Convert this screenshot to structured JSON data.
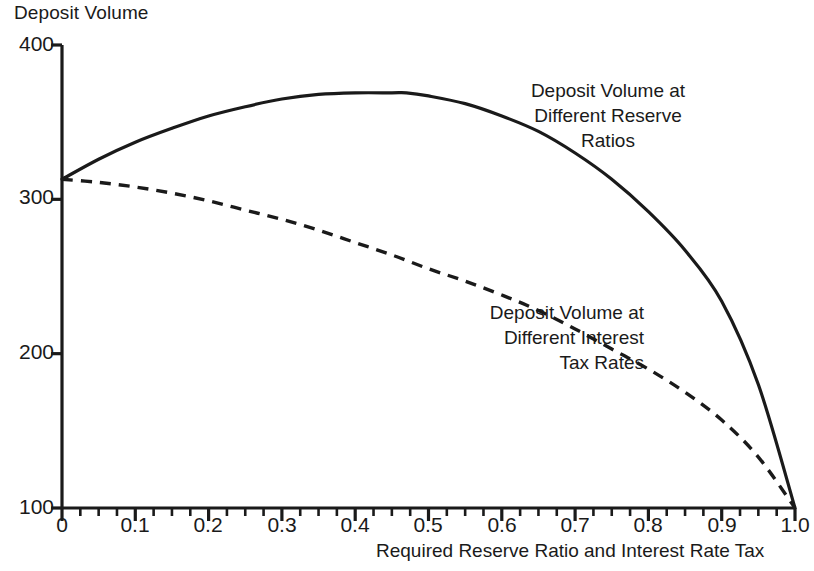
{
  "chart_data": {
    "type": "line",
    "title": "",
    "ylabel": "Deposit Volume",
    "xlabel": "Required Reserve Ratio and Interest Rate Tax",
    "xlim": [
      0,
      1.0
    ],
    "ylim": [
      100,
      400
    ],
    "grid": false,
    "legend_position": "inline-annotations",
    "x_ticks": [
      "0",
      "0.1",
      "0.2",
      "0.3",
      "0.4",
      "0.5",
      "0.6",
      "0.7",
      "0.8",
      "0.9",
      "1.0"
    ],
    "x_tick_values": [
      0,
      0.1,
      0.2,
      0.3,
      0.4,
      0.5,
      0.6,
      0.7,
      0.8,
      0.9,
      1.0
    ],
    "y_ticks": [
      "400",
      "300",
      "200",
      "100"
    ],
    "y_tick_values": [
      400,
      300,
      200,
      100
    ],
    "x_minor_ticks_per_major": 4,
    "series": [
      {
        "name": "Deposit Volume at Different Reserve Ratios",
        "style": "solid",
        "color": "#1a1a1a",
        "x": [
          0.0,
          0.05,
          0.1,
          0.15,
          0.2,
          0.25,
          0.3,
          0.35,
          0.4,
          0.45,
          0.47,
          0.5,
          0.55,
          0.6,
          0.65,
          0.7,
          0.75,
          0.8,
          0.85,
          0.9,
          0.95,
          1.0
        ],
        "values": [
          313,
          326,
          337,
          346,
          354,
          360,
          365,
          368,
          369,
          369,
          369,
          367,
          362,
          354,
          344,
          330,
          313,
          292,
          267,
          234,
          180,
          100
        ]
      },
      {
        "name": "Deposit Volume at Different Interest Tax Rates",
        "style": "dashed",
        "color": "#1a1a1a",
        "x": [
          0.0,
          0.05,
          0.1,
          0.15,
          0.2,
          0.25,
          0.3,
          0.35,
          0.4,
          0.45,
          0.5,
          0.55,
          0.6,
          0.65,
          0.7,
          0.75,
          0.8,
          0.85,
          0.9,
          0.95,
          1.0
        ],
        "values": [
          313,
          311,
          308,
          304,
          299,
          293,
          287,
          280,
          272,
          264,
          255,
          247,
          238,
          228,
          216,
          203,
          190,
          175,
          157,
          133,
          100
        ]
      }
    ],
    "annotations": [
      {
        "name": "reserve-ratio-annotation",
        "text": "Deposit Volume at\nDifferent Reserve\nRatios"
      },
      {
        "name": "interest-tax-annotation",
        "text": "Deposit Volume at\nDifferent Interest\nTax Rates"
      }
    ]
  },
  "axis": {
    "y_title": "Deposit Volume",
    "x_title": "Required Reserve Ratio and Interest Rate Tax",
    "y_labels": [
      "400",
      "300",
      "200",
      "100"
    ],
    "x_labels": [
      "0",
      "0.1",
      "0.2",
      "0.3",
      "0.4",
      "0.5",
      "0.6",
      "0.7",
      "0.8",
      "0.9",
      "1.0"
    ]
  },
  "annotations": {
    "reserve": "Deposit Volume at\nDifferent Reserve\nRatios",
    "interest": "Deposit Volume at\nDifferent Interest\nTax Rates"
  },
  "colors": {
    "ink": "#1a1a1a",
    "background": "#ffffff"
  }
}
